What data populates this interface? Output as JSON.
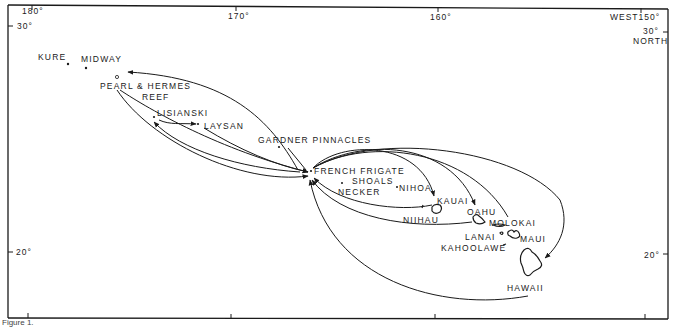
{
  "figure": {
    "caption": "Figure 1."
  },
  "grid": {
    "longitude_labels": [
      {
        "text": "180°",
        "x": 22,
        "y": 8
      },
      {
        "text": "170°",
        "x": 228,
        "y": 8
      },
      {
        "text": "160°",
        "x": 430,
        "y": 8
      },
      {
        "text": "WEST150°",
        "x": 610,
        "y": 8
      }
    ],
    "latitude_labels": [
      {
        "text": "30°",
        "x": 18,
        "y": 22
      },
      {
        "text": "30°",
        "x": 643,
        "y": 26
      },
      {
        "text": "NORTH",
        "x": 632,
        "y": 36
      },
      {
        "text": "20°",
        "x": 16,
        "y": 247
      },
      {
        "text": "20°",
        "x": 645,
        "y": 250
      }
    ]
  },
  "places": [
    {
      "name": "KURE",
      "x": 38,
      "y": 52
    },
    {
      "name": "MIDWAY",
      "x": 82,
      "y": 53
    },
    {
      "name": "PEARL & HERMES",
      "x": 100,
      "y": 82
    },
    {
      "name": "REEF",
      "x": 143,
      "y": 93
    },
    {
      "name": "LISIANSKI",
      "x": 157,
      "y": 109
    },
    {
      "name": "LAYSAN",
      "x": 205,
      "y": 122
    },
    {
      "name": "GARDNER PINNACLES",
      "x": 258,
      "y": 136
    },
    {
      "name": "FRENCH FRIGATE",
      "x": 314,
      "y": 167
    },
    {
      "name": "SHOALS",
      "x": 352,
      "y": 177
    },
    {
      "name": "NECKER",
      "x": 338,
      "y": 188
    },
    {
      "name": "NIHOA",
      "x": 398,
      "y": 185
    },
    {
      "name": "KAUAI",
      "x": 438,
      "y": 197
    },
    {
      "name": "NIIHAU",
      "x": 403,
      "y": 216
    },
    {
      "name": "OAHU",
      "x": 467,
      "y": 207
    },
    {
      "name": "MOLOKAI",
      "x": 489,
      "y": 219
    },
    {
      "name": "LANAI",
      "x": 465,
      "y": 232
    },
    {
      "name": "MAUI",
      "x": 520,
      "y": 234
    },
    {
      "name": "KAHOOLAWE",
      "x": 441,
      "y": 243
    },
    {
      "name": "HAWAII",
      "x": 508,
      "y": 283
    }
  ],
  "legend": {
    "description": "Arrows show movements between islands of the Hawaiian chain"
  }
}
